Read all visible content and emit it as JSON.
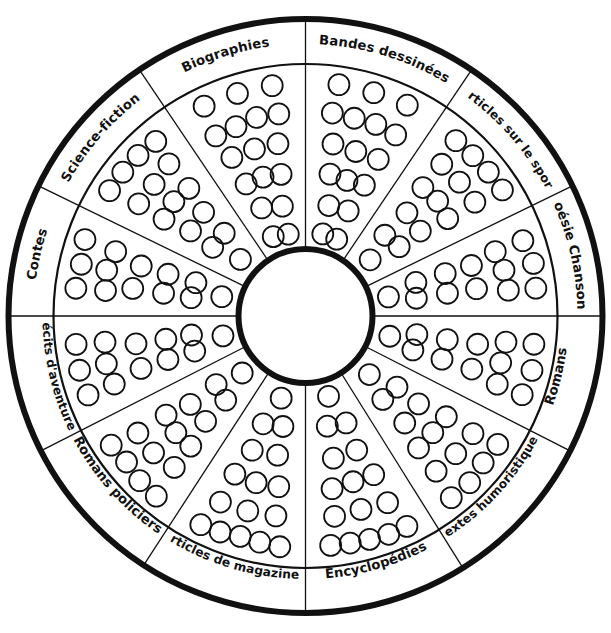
{
  "diagram": {
    "type": "reading-wheel",
    "center_label": "",
    "geometry": {
      "cx": 305.5,
      "cy": 316,
      "outer_radius": 297,
      "label_ring_inner_radius": 252,
      "hub_radius": 67,
      "sector_count": 12
    },
    "colors": {
      "stroke": "#111111",
      "background": "#ffffff",
      "fill": "#ffffff"
    },
    "sectors": [
      {
        "id": "bandes-dessinees",
        "label": "Bandes dessinées",
        "start_deg": -90.0,
        "end_deg": -56.0,
        "dot_count": 17,
        "rows": 6
      },
      {
        "id": "articles-sur-le-sport",
        "label": "Articles sur le sport",
        "start_deg": -56.0,
        "end_deg": -26.0,
        "dot_count": 15,
        "rows": 6
      },
      {
        "id": "poesie-chansons",
        "label": "Poésie Chansons",
        "start_deg": -26.0,
        "end_deg": 0.0,
        "dot_count": 13,
        "rows": 6
      },
      {
        "id": "romans",
        "label": "Romans",
        "start_deg": 0.0,
        "end_deg": 27.0,
        "dot_count": 13,
        "rows": 6
      },
      {
        "id": "textes-humoristiques",
        "label": "Textes humoristiques",
        "start_deg": 27.0,
        "end_deg": 58.0,
        "dot_count": 15,
        "rows": 6
      },
      {
        "id": "encyclopedies",
        "label": "Encyclopédies",
        "start_deg": 58.0,
        "end_deg": 90.0,
        "dot_count": 16,
        "rows": 6
      },
      {
        "id": "articles-de-magazines",
        "label": "Articles de magazines",
        "start_deg": 90.0,
        "end_deg": 123.0,
        "dot_count": 16,
        "rows": 6
      },
      {
        "id": "romans-policiers",
        "label": "Romans policiers",
        "start_deg": 123.0,
        "end_deg": 153.0,
        "dot_count": 15,
        "rows": 6
      },
      {
        "id": "recits-d-aventures",
        "label": "Récits d'aventures",
        "start_deg": 153.0,
        "end_deg": 180.0,
        "dot_count": 13,
        "rows": 6
      },
      {
        "id": "contes",
        "label": "Contes",
        "start_deg": 180.0,
        "end_deg": 206.0,
        "dot_count": 13,
        "rows": 6
      },
      {
        "id": "science-fiction",
        "label": "Science-fiction",
        "start_deg": 206.0,
        "end_deg": 236.0,
        "dot_count": 15,
        "rows": 6
      },
      {
        "id": "biographies",
        "label": "Biographies",
        "start_deg": 236.0,
        "end_deg": 270.0,
        "dot_count": 17,
        "rows": 6
      }
    ]
  }
}
